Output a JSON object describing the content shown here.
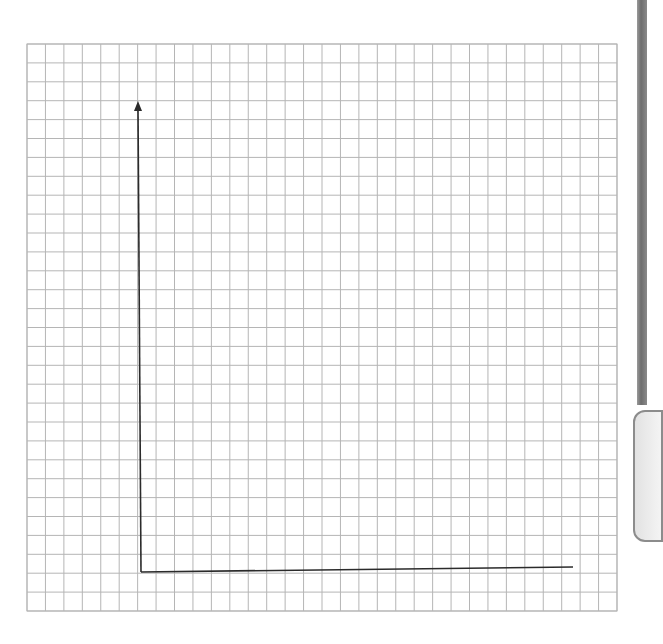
{
  "diagram": {
    "type": "blank-coordinate-grid",
    "grid": {
      "columns": 32,
      "rows": 30,
      "left": 27,
      "top": 44,
      "right": 617,
      "bottom": 611,
      "line_color": "#b5b5b5",
      "line_width": 1
    },
    "axes": {
      "color": "#2b2b2b",
      "origin": [
        141,
        572
      ],
      "y_axis": {
        "top": 101,
        "arrowhead": true
      },
      "x_axis": {
        "right": 573,
        "arrowhead": false
      },
      "x_label": "",
      "y_label": ""
    }
  },
  "colors": {
    "background": "#ffffff",
    "grid": "#b5b5b5",
    "axis": "#2b2b2b"
  }
}
